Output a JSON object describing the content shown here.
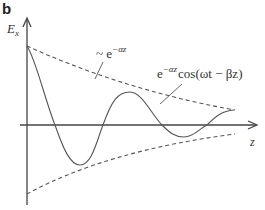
{
  "panel": {
    "label": "b"
  },
  "axes": {
    "y_label_main": "E",
    "y_label_sub": "x",
    "x_label": "z"
  },
  "annotations": {
    "envelope": {
      "prefix": "~ e",
      "exponent": "−αz"
    },
    "wave": {
      "base": "e",
      "exponent": "−αz",
      "suffix": "cos(ωt − βz)"
    }
  },
  "colors": {
    "line": "#555555",
    "axis": "#444444",
    "text": "#333333"
  }
}
